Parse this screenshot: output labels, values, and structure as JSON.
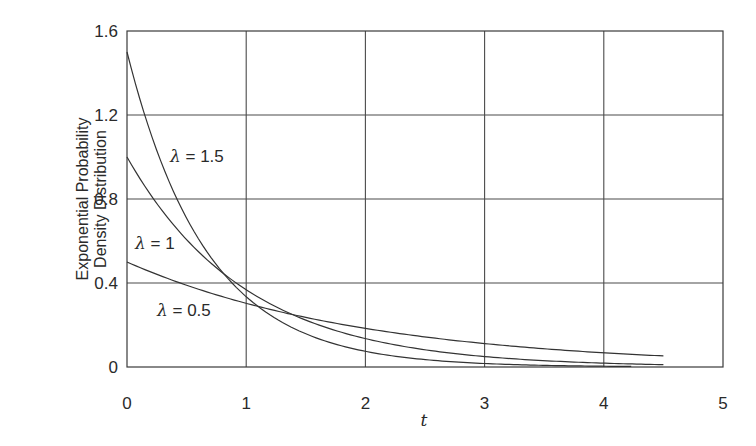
{
  "chart_data": {
    "type": "line",
    "title": "",
    "xlabel": "t",
    "ylabel_lines": [
      "Exponential Probability",
      "Density Distribution"
    ],
    "ylabel": "Exponential Probability Density Distribution",
    "xlim": [
      0,
      5
    ],
    "ylim": [
      0,
      1.6
    ],
    "xticks": [
      0,
      1,
      2,
      3,
      4,
      5
    ],
    "xtick_labels": [
      "0",
      "1",
      "2",
      "3",
      "4",
      "5"
    ],
    "yticks": [
      0,
      0.4,
      0.8,
      1.2,
      1.6
    ],
    "ytick_labels": [
      "0",
      "0.4",
      "0.8",
      "1.2",
      "1.6"
    ],
    "grid": true,
    "legend": "inline labels",
    "function": "f(t) = λ·e^(−λt)",
    "series": [
      {
        "name": "λ = 1.5",
        "lambda": 1.5,
        "label_text": "λ = 1.5",
        "t_end": 4.23,
        "x": [
          0,
          0.5,
          1,
          1.5,
          2,
          2.5,
          3,
          3.5,
          4,
          4.23
        ],
        "values": [
          1.5,
          0.709,
          0.335,
          0.158,
          0.075,
          0.035,
          0.017,
          0.008,
          0.004,
          0.003
        ]
      },
      {
        "name": "λ = 1",
        "lambda": 1,
        "label_text": "λ = 1",
        "t_end": 4.5,
        "x": [
          0,
          0.5,
          1,
          1.5,
          2,
          2.5,
          3,
          3.5,
          4,
          4.5
        ],
        "values": [
          1.0,
          0.607,
          0.368,
          0.223,
          0.135,
          0.082,
          0.05,
          0.03,
          0.018,
          0.011
        ]
      },
      {
        "name": "λ = 0.5",
        "lambda": 0.5,
        "label_text": "λ = 0.5",
        "t_end": 4.5,
        "x": [
          0,
          0.5,
          1,
          1.5,
          2,
          2.5,
          3,
          3.5,
          4,
          4.5
        ],
        "values": [
          0.5,
          0.389,
          0.303,
          0.236,
          0.184,
          0.143,
          0.112,
          0.087,
          0.068,
          0.053
        ]
      }
    ]
  },
  "labels": {
    "curve_1_5": {
      "lam": "λ",
      "rest": " = 1.5"
    },
    "curve_1": {
      "lam": "λ",
      "rest": " = 1"
    },
    "curve_0_5": {
      "lam": "λ",
      "rest": " = 0.5"
    }
  },
  "colors": {
    "line": "#333333",
    "grid": "#4a4a4a",
    "background": "#ffffff"
  }
}
